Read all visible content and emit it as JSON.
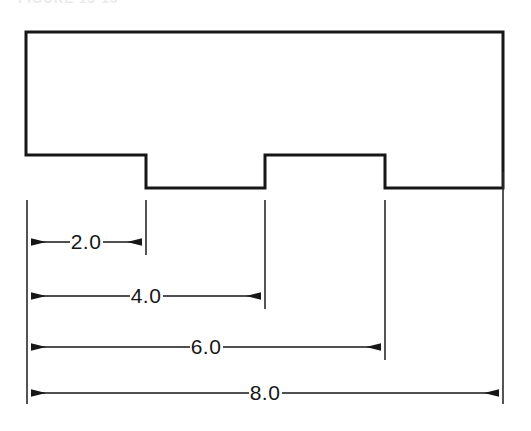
{
  "figure": {
    "type": "engineering-drawing",
    "caption_partial": "FIGURE 13-13",
    "units_note": ""
  },
  "colors": {
    "stroke": "#161616",
    "thin_stroke": "#2a2a2a",
    "background": "#ffffff",
    "text": "#161616"
  },
  "geometry": {
    "outline_label": "part-outline",
    "top_y": 32,
    "base_y": 188,
    "notch_top_y": 155,
    "left_x": 26,
    "right_x": 503,
    "risers_x": [
      146,
      265,
      385
    ],
    "points": "26,32 503,32 503,188 385,188 385,155 265,155 265,188 146,188 146,155 26,155",
    "outline_width": 3
  },
  "dimensions": [
    {
      "id": "dim-2",
      "label": "2.0",
      "value": 2.0,
      "y": 242,
      "from_x": 27,
      "to_x": 146,
      "text_x": 86,
      "arrow_style": "inward-pair"
    },
    {
      "id": "dim-4",
      "label": "4.0",
      "value": 4.0,
      "y": 296,
      "from_x": 27,
      "to_x": 265,
      "text_x": 146,
      "arrow_style": "inward-pair"
    },
    {
      "id": "dim-6",
      "label": "6.0",
      "value": 6.0,
      "y": 347,
      "from_x": 27,
      "to_x": 385,
      "text_x": 206,
      "arrow_style": "inward-pair"
    },
    {
      "id": "dim-8",
      "label": "8.0",
      "value": 8.0,
      "y": 393,
      "from_x": 27,
      "to_x": 503,
      "text_x": 265,
      "arrow_style": "inward-pair"
    }
  ],
  "extension_lines": [
    {
      "id": "ext-left",
      "x": 27,
      "y1": 200,
      "y2": 404
    },
    {
      "id": "ext-2",
      "x": 146,
      "y1": 200,
      "y2": 255
    },
    {
      "id": "ext-4",
      "x": 265,
      "y1": 200,
      "y2": 309
    },
    {
      "id": "ext-6",
      "x": 385,
      "y1": 200,
      "y2": 360
    },
    {
      "id": "ext-right",
      "x": 503,
      "y1": 172,
      "y2": 404
    }
  ]
}
